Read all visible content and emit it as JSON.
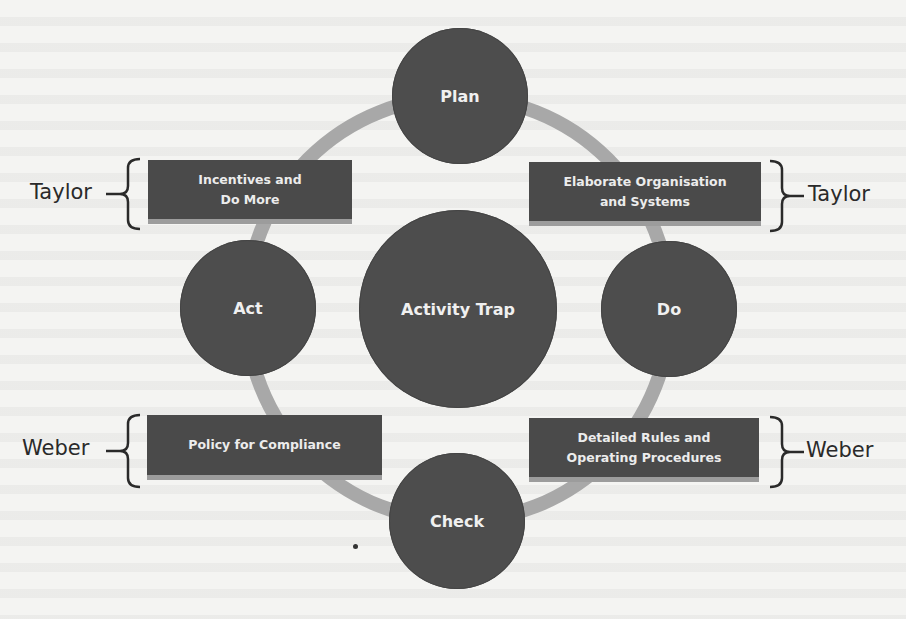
{
  "diagram": {
    "type": "cycle",
    "center": {
      "label": "Activity Trap"
    },
    "cycle_nodes": [
      {
        "id": "plan",
        "label": "Plan"
      },
      {
        "id": "do",
        "label": "Do"
      },
      {
        "id": "check",
        "label": "Check"
      },
      {
        "id": "act",
        "label": "Act"
      }
    ],
    "boxes": {
      "top_left": {
        "lines": [
          "Incentives and",
          "Do More"
        ],
        "attributed_to": "Taylor"
      },
      "top_right": {
        "lines": [
          "Elaborate Organisation",
          "and Systems"
        ],
        "attributed_to": "Taylor"
      },
      "bottom_left": {
        "lines": [
          "Policy for Compliance"
        ],
        "attributed_to": "Weber"
      },
      "bottom_right": {
        "lines": [
          "Detailed Rules and",
          "Operating Procedures"
        ],
        "attributed_to": "Weber"
      }
    },
    "side_labels": {
      "top_left": "Taylor",
      "top_right": "Taylor",
      "bottom_left": "Weber",
      "bottom_right": "Weber"
    },
    "colors": {
      "node_fill": "#4d4d4d",
      "box_fill": "#4a4a4a",
      "box_bottom_edge": "#9c9c9c",
      "ring": "#a8a8a8",
      "node_text": "#f0f0f0",
      "label_text": "#2a2a2a",
      "background": "#f4f4f2"
    }
  }
}
